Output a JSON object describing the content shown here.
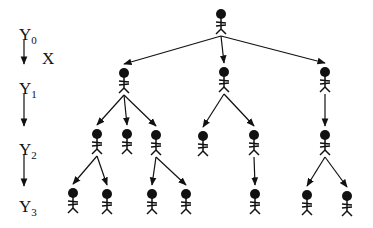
{
  "levels": [
    {
      "label": "Y",
      "sub": "0"
    },
    {
      "label": "Y",
      "sub": "1"
    },
    {
      "label": "Y",
      "sub": "2"
    },
    {
      "label": "Y",
      "sub": "3"
    }
  ],
  "x_label": "X",
  "colors": {
    "ink": "#111111",
    "background": "#ffffff"
  },
  "nodes": [
    {
      "id": "root",
      "level": 0,
      "x": 221,
      "y": 14
    },
    {
      "id": "a",
      "level": 1,
      "x": 124,
      "y": 73
    },
    {
      "id": "b",
      "level": 1,
      "x": 224,
      "y": 72
    },
    {
      "id": "c",
      "level": 1,
      "x": 325,
      "y": 72
    },
    {
      "id": "a1",
      "level": 2,
      "x": 97,
      "y": 134
    },
    {
      "id": "a2",
      "level": 2,
      "x": 127,
      "y": 134
    },
    {
      "id": "a3",
      "level": 2,
      "x": 156,
      "y": 135
    },
    {
      "id": "b1",
      "level": 2,
      "x": 203,
      "y": 136
    },
    {
      "id": "b2",
      "level": 2,
      "x": 254,
      "y": 135
    },
    {
      "id": "c1",
      "level": 2,
      "x": 325,
      "y": 135
    },
    {
      "id": "a1a",
      "level": 3,
      "x": 73,
      "y": 193
    },
    {
      "id": "a1b",
      "level": 3,
      "x": 107,
      "y": 194
    },
    {
      "id": "a3a",
      "level": 3,
      "x": 152,
      "y": 194
    },
    {
      "id": "a3b",
      "level": 3,
      "x": 186,
      "y": 194
    },
    {
      "id": "b2a",
      "level": 3,
      "x": 255,
      "y": 194
    },
    {
      "id": "c1a",
      "level": 3,
      "x": 307,
      "y": 195
    },
    {
      "id": "c1b",
      "level": 3,
      "x": 347,
      "y": 196
    }
  ],
  "edges": [
    [
      "root",
      "a"
    ],
    [
      "root",
      "b"
    ],
    [
      "root",
      "c"
    ],
    [
      "a",
      "a1"
    ],
    [
      "a",
      "a2"
    ],
    [
      "a",
      "a3"
    ],
    [
      "b",
      "b1"
    ],
    [
      "b",
      "b2"
    ],
    [
      "c",
      "c1"
    ],
    [
      "a1",
      "a1a"
    ],
    [
      "a1",
      "a1b"
    ],
    [
      "a3",
      "a3a"
    ],
    [
      "a3",
      "a3b"
    ],
    [
      "b2",
      "b2a"
    ],
    [
      "c1",
      "c1a"
    ],
    [
      "c1",
      "c1b"
    ]
  ]
}
